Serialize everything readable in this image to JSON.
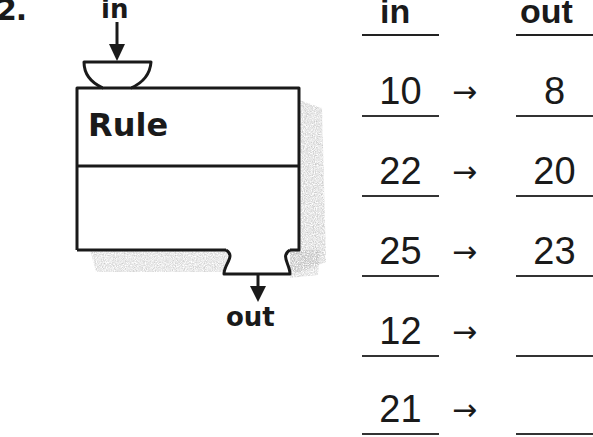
{
  "problem": {
    "number": "2."
  },
  "machine": {
    "input_label": "in",
    "output_label": "out",
    "rule_label": "Rule",
    "rule_value": ""
  },
  "table": {
    "headers": {
      "in": "in",
      "out": "out"
    },
    "arrow": "→",
    "rows": [
      {
        "in": "10",
        "out": "8"
      },
      {
        "in": "22",
        "out": "20"
      },
      {
        "in": "25",
        "out": "23"
      },
      {
        "in": "12",
        "out": ""
      },
      {
        "in": "21",
        "out": ""
      }
    ]
  },
  "colors": {
    "ink": "#1a1a1a",
    "shadow": "#9a9a9a",
    "background": "#ffffff"
  }
}
